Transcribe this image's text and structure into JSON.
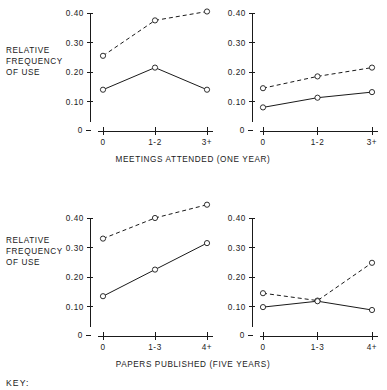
{
  "figure": {
    "background": "#ffffff",
    "ink_color": "#1a1a1a",
    "key_label": "KEY:",
    "y_axis_label_lines": [
      "RELATIVE",
      "FREQUENCY",
      "OF USE"
    ]
  },
  "chart_data": [
    {
      "id": "top-left",
      "type": "line",
      "title": "",
      "xlabel": "MEETINGS ATTENDED (ONE YEAR)",
      "ylabel": "RELATIVE FREQUENCY OF USE",
      "categories": [
        "0",
        "1-2",
        "3+"
      ],
      "yticks": [
        "0.40",
        "0.30",
        "0.20",
        "0.10",
        "0"
      ],
      "ytick_values": [
        0.4,
        0.3,
        0.2,
        0.1,
        0
      ],
      "ylim": [
        0,
        0.44
      ],
      "grid": false,
      "legend": "none",
      "series": [
        {
          "name": "dashed",
          "style": "dashed",
          "values": [
            0.255,
            0.375,
            0.405
          ]
        },
        {
          "name": "solid",
          "style": "solid",
          "values": [
            0.14,
            0.215,
            0.14
          ]
        }
      ]
    },
    {
      "id": "top-right",
      "type": "line",
      "title": "",
      "xlabel": "MEETINGS ATTENDED (ONE YEAR)",
      "ylabel": "",
      "categories": [
        "0",
        "1-2",
        "3+"
      ],
      "yticks": [
        "0.40",
        "0.30",
        "0.20",
        "0.10",
        "0"
      ],
      "ytick_values": [
        0.4,
        0.3,
        0.2,
        0.1,
        0
      ],
      "ylim": [
        0,
        0.44
      ],
      "grid": false,
      "legend": "none",
      "series": [
        {
          "name": "dashed",
          "style": "dashed",
          "values": [
            0.145,
            0.185,
            0.215
          ]
        },
        {
          "name": "solid",
          "style": "solid",
          "values": [
            0.08,
            0.113,
            0.132
          ]
        }
      ]
    },
    {
      "id": "bottom-left",
      "type": "line",
      "title": "",
      "xlabel": "PAPERS PUBLISHED (FIVE YEARS)",
      "ylabel": "RELATIVE FREQUENCY OF USE",
      "categories": [
        "0",
        "1-3",
        "4+"
      ],
      "yticks": [
        "0.40",
        "0.30",
        "0.20",
        "0.10",
        "0"
      ],
      "ytick_values": [
        0.4,
        0.3,
        0.2,
        0.1,
        0
      ],
      "ylim": [
        0,
        0.47
      ],
      "grid": false,
      "legend": "none",
      "series": [
        {
          "name": "dashed",
          "style": "dashed",
          "values": [
            0.33,
            0.4,
            0.445
          ]
        },
        {
          "name": "solid",
          "style": "solid",
          "values": [
            0.135,
            0.225,
            0.315
          ]
        }
      ]
    },
    {
      "id": "bottom-right",
      "type": "line",
      "title": "",
      "xlabel": "PAPERS PUBLISHED (FIVE YEARS)",
      "ylabel": "",
      "categories": [
        "0",
        "1-3",
        "4+"
      ],
      "yticks": [
        "0.40",
        "0.30",
        "0.20",
        "0.10",
        "0"
      ],
      "ytick_values": [
        0.4,
        0.3,
        0.2,
        0.1,
        0
      ],
      "ylim": [
        0,
        0.47
      ],
      "grid": false,
      "legend": "none",
      "series": [
        {
          "name": "dashed",
          "style": "dashed",
          "values": [
            0.145,
            0.12,
            0.248
          ]
        },
        {
          "name": "solid",
          "style": "solid",
          "values": [
            0.098,
            0.118,
            0.088
          ]
        }
      ]
    }
  ],
  "panels": {
    "top": {
      "xlabel": "MEETINGS ATTENDED (ONE YEAR)"
    },
    "bottom": {
      "xlabel": "PAPERS PUBLISHED (FIVE YEARS)"
    }
  }
}
